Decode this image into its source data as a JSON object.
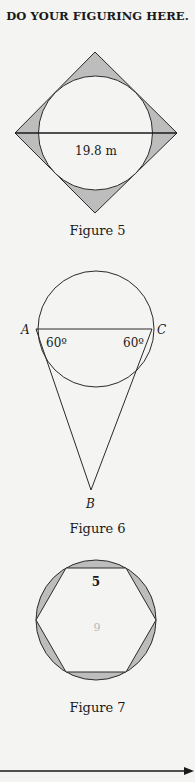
{
  "header": {
    "title": "DO YOUR FIGURING HERE."
  },
  "figures": [
    {
      "caption": "Figure 5",
      "description": "Square rotated 45° with inscribed circle; shaded corner regions",
      "diagonal_label": "19.8 m"
    },
    {
      "caption": "Figure 6",
      "description": "Circle with chord AC; triangle ABC below",
      "labels": {
        "A": "A",
        "C": "C",
        "B": "B"
      },
      "angle_A": "60º",
      "angle_C": "60º"
    },
    {
      "caption": "Figure 7",
      "description": "Regular hexagon inscribed in circle; shaded segments",
      "side_label": "5",
      "handwritten_note": "6"
    }
  ],
  "footer": {
    "arrow": "right-arrow"
  },
  "colors": {
    "shade": "#bdbdbd",
    "line": "#2a2a2a",
    "background": "#f4f4f2"
  }
}
